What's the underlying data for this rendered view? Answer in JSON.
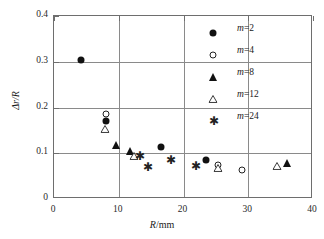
{
  "chart_data": {
    "type": "scatter",
    "title": "",
    "xlabel": "R/mm",
    "ylabel": "Δr/R",
    "xlim": [
      0,
      40
    ],
    "ylim": [
      0,
      0.4
    ],
    "xticks": [
      0,
      10,
      20,
      30,
      40
    ],
    "yticks": [
      0,
      0.1,
      0.2,
      0.3,
      0.4
    ],
    "xtick_labels": [
      "0",
      "10",
      "20",
      "30",
      "40"
    ],
    "ytick_labels": [
      "0",
      "0.1",
      "0.2",
      "0.3",
      "0.4"
    ],
    "grid": "both",
    "legend_position": "upper right inside",
    "series": [
      {
        "name": "m=2",
        "label_var": "m",
        "label_value": "=2",
        "marker": "filled-circle",
        "color": "#111111",
        "points": [
          {
            "x": 4.2,
            "y": 0.304
          },
          {
            "x": 8.0,
            "y": 0.17
          },
          {
            "x": 16.5,
            "y": 0.113
          },
          {
            "x": 23.4,
            "y": 0.085
          }
        ]
      },
      {
        "name": "m=4",
        "label_var": "m",
        "label_value": "=4",
        "marker": "open-circle",
        "color": "#222222",
        "points": [
          {
            "x": 8.0,
            "y": 0.185
          },
          {
            "x": 25.3,
            "y": 0.074
          },
          {
            "x": 29.0,
            "y": 0.064
          }
        ]
      },
      {
        "name": "m=8",
        "label_var": "m",
        "label_value": "=8",
        "marker": "filled-triangle",
        "color": "#111111",
        "points": [
          {
            "x": 9.6,
            "y": 0.117
          },
          {
            "x": 11.7,
            "y": 0.104
          },
          {
            "x": 36.0,
            "y": 0.079
          }
        ]
      },
      {
        "name": "m=12",
        "label_var": "m",
        "label_value": "=12",
        "marker": "open-triangle",
        "color": "#222222",
        "points": [
          {
            "x": 7.8,
            "y": 0.154
          },
          {
            "x": 12.3,
            "y": 0.095
          },
          {
            "x": 25.3,
            "y": 0.068
          },
          {
            "x": 34.5,
            "y": 0.072
          }
        ]
      },
      {
        "name": "m=24",
        "label_var": "m",
        "label_value": "=24",
        "marker": "asterisk",
        "color": "#222222",
        "points": [
          {
            "x": 13.2,
            "y": 0.093
          },
          {
            "x": 14.4,
            "y": 0.07
          },
          {
            "x": 18.0,
            "y": 0.086
          },
          {
            "x": 21.9,
            "y": 0.072
          }
        ]
      }
    ]
  }
}
